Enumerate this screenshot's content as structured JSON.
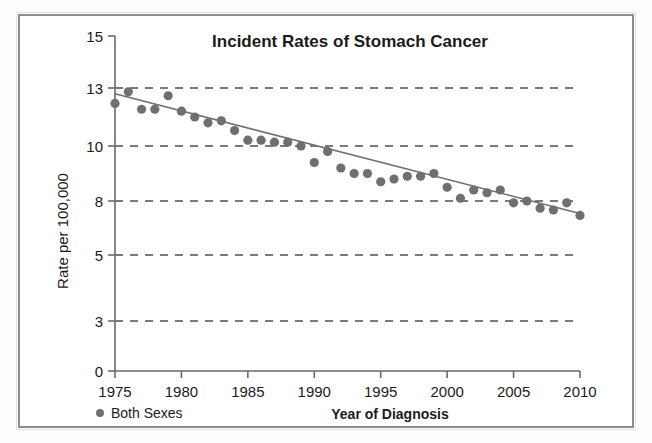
{
  "frame": {
    "border_color": "#8d8d8d",
    "background": "#ffffff"
  },
  "chart_data": {
    "type": "scatter",
    "title": "Incident Rates of Stomach Cancer",
    "xlabel": "Year of Diagnosis",
    "ylabel": "Rate per 100,000",
    "xlim": [
      1975,
      2010
    ],
    "ylim": [
      0,
      15
    ],
    "grid": true,
    "grid_values": [
      13,
      10,
      8,
      5,
      3
    ],
    "legend_position": "bottom-left",
    "marker_color": "#6f6f6f",
    "line_color": "#6f6f6f",
    "axis_color": "#6a6a6a",
    "xticks": [
      1975,
      1980,
      1985,
      1990,
      1995,
      2000,
      2005,
      2010
    ],
    "xticklabels": [
      "1975",
      "1980",
      "1985",
      "1990",
      "1995",
      "2000",
      "2005",
      "2010"
    ],
    "yticks": [
      0,
      3,
      5,
      8,
      10,
      13,
      15
    ],
    "yticklabels": [
      "0",
      "3",
      "5",
      "8",
      "10",
      "13",
      "15"
    ],
    "legend": [
      {
        "label": "Both Sexes",
        "marker": "circle",
        "color": "#6f6f6f"
      }
    ],
    "series": [
      {
        "name": "Both Sexes",
        "x": [
          1975,
          1976,
          1977,
          1978,
          1979,
          1980,
          1981,
          1982,
          1983,
          1984,
          1985,
          1986,
          1987,
          1988,
          1989,
          1990,
          1991,
          1992,
          1993,
          1994,
          1995,
          1996,
          1997,
          1998,
          1999,
          2000,
          2001,
          2002,
          2003,
          2004,
          2005,
          2006,
          2007,
          2008,
          2009,
          2010
        ],
        "values": [
          12.2,
          12.8,
          11.9,
          11.9,
          12.6,
          11.8,
          11.5,
          11.2,
          11.3,
          10.8,
          10.3,
          10.3,
          10.2,
          10.2,
          10.0,
          9.4,
          9.8,
          9.2,
          9.0,
          9.0,
          8.7,
          8.8,
          8.9,
          8.9,
          9.0,
          8.5,
          8.1,
          8.4,
          8.3,
          8.4,
          7.9,
          8.0,
          7.6,
          7.5,
          7.9,
          7.2
        ]
      }
    ],
    "trendline": {
      "visible": true,
      "start": {
        "x": 1975,
        "y": 12.7
      },
      "end": {
        "x": 2010,
        "y": 7.3
      }
    }
  }
}
